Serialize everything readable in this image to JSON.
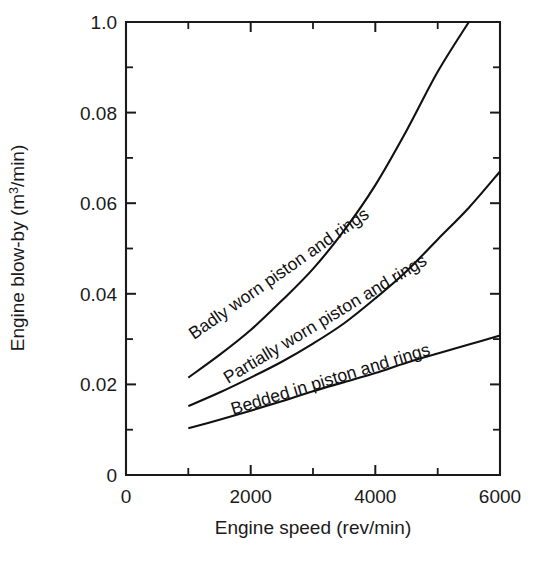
{
  "chart_data": {
    "type": "line",
    "title": "",
    "xlabel": "Engine speed (rev/min)",
    "ylabel_parts": {
      "before": "Engine blow-by (m",
      "superscript": "3",
      "after": "/min)"
    },
    "ylabel": "Engine blow-by (m3/min)",
    "xlim": [
      0,
      6000
    ],
    "ylim": [
      0,
      0.1
    ],
    "grid": false,
    "legend": "inline-curve-labels",
    "x_ticks_major": [
      0,
      2000,
      4000,
      6000
    ],
    "x_tick_labels": [
      "0",
      "2000",
      "4000",
      "6000"
    ],
    "x_ticks_minor": [
      1000,
      3000,
      5000
    ],
    "y_ticks_major": [
      0,
      0.02,
      0.04,
      0.06,
      0.08,
      0.1
    ],
    "y_tick_labels": [
      "0",
      "0.02",
      "0.04",
      "0.06",
      "0.08",
      "1.0"
    ],
    "y_ticks_minor": [
      0.01,
      0.03,
      0.05,
      0.07,
      0.09
    ],
    "series": [
      {
        "name": "Badly worn piston and rings",
        "label": "Badly worn piston and rings",
        "label_rotation_deg": -35,
        "x": [
          1000,
          1500,
          2000,
          2500,
          3000,
          3500,
          4000,
          4500,
          5000,
          5500
        ],
        "values": [
          0.0215,
          0.0265,
          0.032,
          0.0385,
          0.0455,
          0.054,
          0.064,
          0.076,
          0.089,
          0.1
        ]
      },
      {
        "name": "Partially worn piston and rings",
        "label": "Partially worn piston and rings",
        "label_rotation_deg": -30,
        "x": [
          1000,
          1500,
          2000,
          2500,
          3000,
          3500,
          4000,
          4500,
          5000,
          5500,
          6000
        ],
        "values": [
          0.0152,
          0.0182,
          0.0215,
          0.025,
          0.029,
          0.0335,
          0.039,
          0.045,
          0.052,
          0.059,
          0.067
        ]
      },
      {
        "name": "Bedded in piston and rings",
        "label": "Bedded in piston and rings",
        "label_rotation_deg": -16,
        "x": [
          1000,
          1500,
          2000,
          2500,
          3000,
          3500,
          4000,
          4500,
          5000,
          5500,
          6000
        ],
        "values": [
          0.0103,
          0.0122,
          0.0142,
          0.0163,
          0.0185,
          0.0205,
          0.0225,
          0.0248,
          0.0268,
          0.0288,
          0.0308
        ]
      }
    ]
  },
  "colors": {
    "ink": "#111111",
    "axis": "#1a1a1a",
    "background": "#ffffff"
  }
}
